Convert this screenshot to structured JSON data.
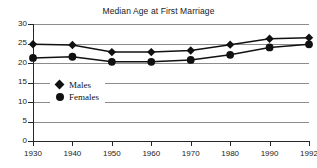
{
  "chart_data": {
    "type": "line",
    "title": "Median Age at First Marriage",
    "xlabel": "",
    "ylabel": "",
    "x": [
      "1930",
      "1940",
      "1950",
      "1960",
      "1970",
      "1980",
      "1990",
      "1992"
    ],
    "categories": [
      "1930",
      "1940",
      "1950",
      "1960",
      "1970",
      "1980",
      "1990",
      "1992"
    ],
    "series": [
      {
        "name": "Males",
        "marker": "diamond",
        "color": "#111111",
        "values": [
          24.8,
          24.6,
          22.8,
          22.8,
          23.2,
          24.7,
          26.2,
          26.5
        ]
      },
      {
        "name": "Females",
        "marker": "circle",
        "color": "#111111",
        "values": [
          21.3,
          21.6,
          20.3,
          20.3,
          20.8,
          22.1,
          24.0,
          24.8
        ]
      }
    ],
    "ylim": [
      0,
      30
    ],
    "yticks": [
      "0",
      "5",
      "10",
      "15",
      "20",
      "25",
      "30"
    ],
    "ytick_values": [
      0,
      5,
      10,
      15,
      20,
      25,
      30
    ],
    "grid": true,
    "grid_color": "#8c8c8c",
    "legend_position": "inside-left",
    "axis_color": "#262626",
    "background": "#ffffff"
  },
  "legend": {
    "items": [
      {
        "label": "Males",
        "marker": "diamond-marker"
      },
      {
        "label": "Females",
        "marker": "circle-marker"
      }
    ]
  }
}
